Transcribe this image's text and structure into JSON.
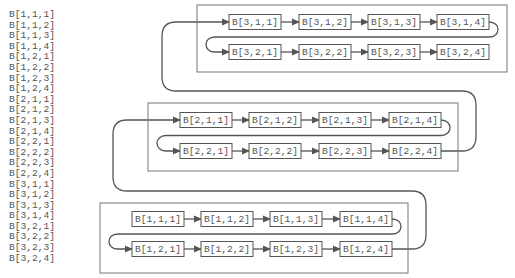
{
  "element_list": [
    "B[1,1,1]",
    "B[1,1,2]",
    "B[1,1,3]",
    "B[1,1,4]",
    "B[1,2,1]",
    "B[1,2,2]",
    "B[1,2,3]",
    "B[1,2,4]",
    "B[2,1,1]",
    "B[2,1,2]",
    "B[2,1,3]",
    "B[2,1,4]",
    "B[2,2,1]",
    "B[2,2,2]",
    "B[2,2,3]",
    "B[2,2,4]",
    "B[3,1,1]",
    "B[3,1,2]",
    "B[3,1,3]",
    "B[3,1,4]",
    "B[3,2,1]",
    "B[3,2,2]",
    "B[3,2,3]",
    "B[3,2,4]"
  ],
  "groups": [
    {
      "name": "group-3",
      "frame": {
        "x": 197,
        "y": 5,
        "w": 310,
        "h": 67
      },
      "rows": [
        {
          "y": 22,
          "nodes": [
            {
              "label": "B[3,1,1]",
              "x": 229
            },
            {
              "label": "B[3,1,2]",
              "x": 299
            },
            {
              "label": "B[3,1,3]",
              "x": 368
            },
            {
              "label": "B[3,1,4]",
              "x": 437
            }
          ]
        },
        {
          "y": 52,
          "nodes": [
            {
              "label": "B[3,2,1]",
              "x": 229
            },
            {
              "label": "B[3,2,2]",
              "x": 299
            },
            {
              "label": "B[3,2,3]",
              "x": 368
            },
            {
              "label": "B[3,2,4]",
              "x": 437
            }
          ]
        }
      ]
    },
    {
      "name": "group-2",
      "frame": {
        "x": 148,
        "y": 103,
        "w": 310,
        "h": 68
      },
      "rows": [
        {
          "y": 120,
          "nodes": [
            {
              "label": "B[2,1,1]",
              "x": 180
            },
            {
              "label": "B[2,1,2]",
              "x": 249
            },
            {
              "label": "B[2,1,3]",
              "x": 319
            },
            {
              "label": "B[2,1,4]",
              "x": 389
            }
          ]
        },
        {
          "y": 151,
          "nodes": [
            {
              "label": "B[2,2,1]",
              "x": 180
            },
            {
              "label": "B[2,2,2]",
              "x": 249
            },
            {
              "label": "B[2,2,3]",
              "x": 319
            },
            {
              "label": "B[2,2,4]",
              "x": 389
            }
          ]
        }
      ]
    },
    {
      "name": "group-1",
      "frame": {
        "x": 100,
        "y": 203,
        "w": 308,
        "h": 70
      },
      "rows": [
        {
          "y": 219,
          "nodes": [
            {
              "label": "B[1,1,1]",
              "x": 132
            },
            {
              "label": "B[1,1,2]",
              "x": 201
            },
            {
              "label": "B[1,1,3]",
              "x": 270
            },
            {
              "label": "B[1,1,4]",
              "x": 340
            }
          ]
        },
        {
          "y": 249,
          "nodes": [
            {
              "label": "B[1,2,1]",
              "x": 132
            },
            {
              "label": "B[1,2,2]",
              "x": 201
            },
            {
              "label": "B[1,2,3]",
              "x": 270
            },
            {
              "label": "B[1,2,4]",
              "x": 340
            }
          ]
        }
      ]
    }
  ],
  "node_width": 52,
  "node_height": 15,
  "colors": {
    "stroke": "#555555",
    "frame": "#777777",
    "text": "#555555",
    "background": "#ffffff"
  }
}
